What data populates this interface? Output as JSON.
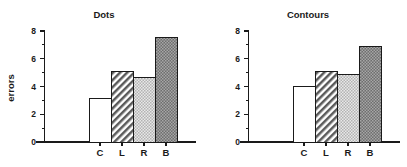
{
  "figure": {
    "background": "#ffffff",
    "axis_color": "#1a1a1a"
  },
  "chart_data": [
    {
      "type": "bar",
      "title": "Dots",
      "xlabel": "",
      "ylabel": "errors",
      "categories": [
        "C",
        "L",
        "R",
        "B"
      ],
      "values": [
        3.15,
        5.05,
        4.65,
        7.5
      ],
      "ylim": [
        0,
        8
      ],
      "yticks": [
        0,
        2,
        4,
        6,
        8
      ],
      "ytick_labels": [
        "0",
        "2",
        "4",
        "6",
        "8"
      ],
      "yminor_ticks": [
        1,
        3,
        5,
        7
      ],
      "grid": false,
      "legend": "none",
      "bar_fills": [
        "white",
        "diagonal-hatch",
        "light-stipple",
        "dark-stipple"
      ],
      "bar_colors": [
        "#ffffff",
        "#cfcfcf",
        "#d4d4d4",
        "#8a8a8a"
      ]
    },
    {
      "type": "bar",
      "title": "Contours",
      "xlabel": "",
      "ylabel": "",
      "categories": [
        "C",
        "L",
        "R",
        "B"
      ],
      "values": [
        4.0,
        5.05,
        4.85,
        6.9
      ],
      "ylim": [
        0,
        8
      ],
      "yticks": [
        0,
        2,
        4,
        6,
        8
      ],
      "ytick_labels": [
        "0",
        "2",
        "4",
        "6",
        "8"
      ],
      "yminor_ticks": [
        1,
        3,
        5,
        7
      ],
      "grid": false,
      "legend": "none",
      "bar_fills": [
        "white",
        "diagonal-hatch",
        "light-stipple",
        "dark-stipple"
      ],
      "bar_colors": [
        "#ffffff",
        "#cfcfcf",
        "#d4d4d4",
        "#8a8a8a"
      ]
    }
  ]
}
